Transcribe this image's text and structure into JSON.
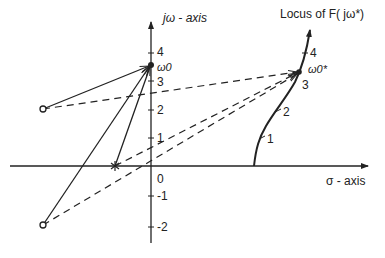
{
  "labels": {
    "jw_axis": "jω - axis",
    "sigma_axis": "σ - axis",
    "locus_title": "Locus of F( jω*)",
    "omega0": "ω0",
    "omega0_star": "ω0*",
    "origin": "0"
  },
  "imag_ticks": [
    "4",
    "3",
    "2",
    "1",
    "-1",
    "-2"
  ],
  "locus_ticks": [
    "1",
    "2",
    "3",
    "4"
  ],
  "elements": {
    "poles": [
      {
        "re": -3.8,
        "im": 2.1
      },
      {
        "re": -3.8,
        "im": -2.1
      }
    ],
    "zero": {
      "re": -1.3,
      "im": 0
    },
    "omega0_point": {
      "re": 0,
      "im": 3.6
    },
    "omega0_star_point": {
      "label": "ω0* on locus of F(jω*)"
    }
  },
  "colors": {
    "ink": "#222222",
    "background": "#ffffff"
  }
}
